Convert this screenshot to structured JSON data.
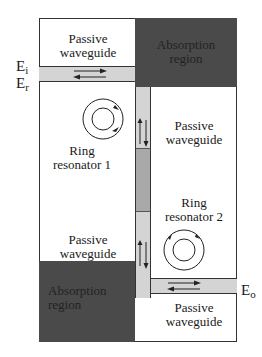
{
  "diagram": {
    "type": "coupled ring resonator waveguide schematic",
    "colors": {
      "absorption_region": "#4a4a4a",
      "waveguide_light": "#d4d4d4",
      "waveguide_mid": "#a9a9a9",
      "outline": "#333333",
      "background": "#ffffff"
    },
    "regions": {
      "passive_top_left": "Passive waveguide",
      "passive_top_left_l1": "Passive",
      "passive_top_left_l2": "waveguide",
      "absorption_top_right_l1": "Absorption",
      "absorption_top_right_l2": "region",
      "ring1_l1": "Ring",
      "ring1_l2": "resonator 1",
      "passive_mid_right_l1": "Passive",
      "passive_mid_right_l2": "waveguide",
      "ring2_l1": "Ring",
      "ring2_l2": "resonator 2",
      "passive_bottom_left_l1": "Passive",
      "passive_bottom_left_l2": "waveguide",
      "absorption_bottom_left_l1": "Absorption",
      "absorption_bottom_left_l2": "region",
      "passive_bottom_right_l1": "Passive",
      "passive_bottom_right_l2": "waveguide"
    },
    "ports": {
      "input_E": "E",
      "input_sub": "i",
      "reflected_E": "E",
      "reflected_sub": "r",
      "output_E": "E",
      "output_sub": "o"
    }
  }
}
